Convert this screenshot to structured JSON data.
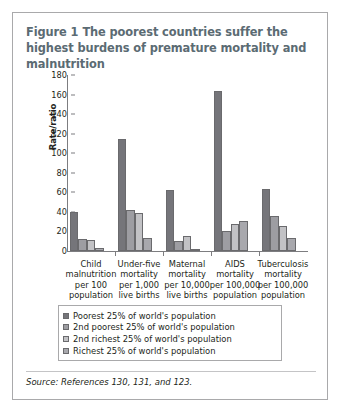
{
  "figure": {
    "number_label": "Figure 1",
    "title": "The poorest countries suffer the highest burdens of premature mortality and malnutrition",
    "source_note": "Source: References 130, 131, and 123."
  },
  "legend": {
    "items": [
      {
        "label": "Poorest 25% of world's population",
        "color": "#75757a",
        "swatch_name": "legend-swatch-poorest"
      },
      {
        "label": "2nd poorest 25% of world's population",
        "color": "#9d9da2",
        "swatch_name": "legend-swatch-2nd-poorest"
      },
      {
        "label": "2nd richest 25% of world's population",
        "color": "#c2c2c5",
        "swatch_name": "legend-swatch-2nd-richest"
      },
      {
        "label": "Richest 25% of world's population",
        "color": "#a8a8ad",
        "swatch_name": "legend-swatch-richest"
      }
    ]
  },
  "chart_data": {
    "type": "bar",
    "title": "The poorest countries suffer the highest burdens of premature mortality and malnutrition",
    "subtitle": "",
    "xlabel": "",
    "ylabel": "Rate/ratio",
    "ylim": [
      0,
      180
    ],
    "yticks": [
      0,
      20,
      40,
      60,
      80,
      100,
      120,
      140,
      160,
      180
    ],
    "ytick_labels": [
      "0",
      "20",
      "40",
      "60",
      "80",
      "100",
      "120",
      "140",
      "160",
      "180"
    ],
    "grid": false,
    "legend_position": "below-plot",
    "categories": [
      "Child malnutrition per 100 population",
      "Under-five mortality per 1,000 live births",
      "Maternal mortality per 10,000 live births",
      "AIDS mortality per 100,000 population",
      "Tuberculosis mortality per 100,000 population"
    ],
    "category_lines": [
      [
        "Child",
        "malnutrition",
        "per 100",
        "population"
      ],
      [
        "Under-five",
        "mortality",
        "per 1,000",
        "live births"
      ],
      [
        "Maternal",
        "mortality",
        "per 10,000",
        "live births"
      ],
      [
        "AIDS",
        "mortality",
        "per 100,000",
        "population"
      ],
      [
        "Tuberculosis",
        "mortality",
        "per 100,000",
        "population"
      ]
    ],
    "series": [
      {
        "name": "Poorest 25% of world's population",
        "color": "#75757a",
        "values": [
          40,
          115,
          62,
          164,
          63
        ]
      },
      {
        "name": "2nd poorest 25% of world's population",
        "color": "#9d9da2",
        "values": [
          12,
          42,
          10,
          20,
          36
        ]
      },
      {
        "name": "2nd richest 25% of world's population",
        "color": "#c2c2c5",
        "values": [
          11,
          39,
          15,
          28,
          26
        ]
      },
      {
        "name": "Richest 25% of world's population",
        "color": "#a8a8ad",
        "values": [
          3.5,
          13,
          2.5,
          31,
          13
        ]
      }
    ]
  }
}
